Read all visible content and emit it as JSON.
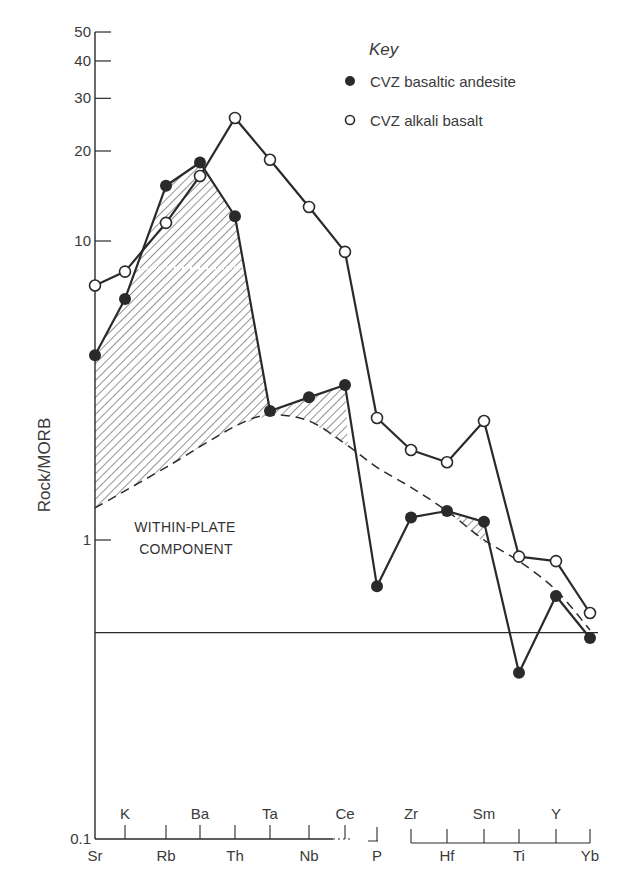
{
  "chart_data": {
    "type": "line",
    "title": "",
    "ylabel": "Rock/MORB",
    "xlabel": "",
    "yscale": "log",
    "ylim": [
      0.1,
      50
    ],
    "y_ticks": [
      0.1,
      1,
      10,
      20,
      30,
      40,
      50
    ],
    "y_tick_labels": [
      "0.1",
      "1",
      "10",
      "20",
      "30",
      "40",
      "50"
    ],
    "categories": [
      "Sr",
      "K",
      "Rb",
      "Ba",
      "Th",
      "Ta",
      "Nb",
      "Ce",
      "P",
      "Zr",
      "Hf",
      "Sm",
      "Ti",
      "Y",
      "Yb"
    ],
    "category_label_rows": {
      "upper": [
        "K",
        "Ba",
        "Ta",
        "Ce",
        "Zr",
        "Sm",
        "Y"
      ],
      "lower": [
        "Sr",
        "Rb",
        "Th",
        "Nb",
        "P",
        "Hf",
        "Ti",
        "Yb"
      ]
    },
    "series": [
      {
        "name": "CVZ basaltic andesite",
        "marker": "filled-circle",
        "values": [
          4.15,
          6.4,
          15.3,
          18.3,
          12.1,
          2.7,
          3.0,
          3.3,
          0.7,
          1.19,
          1.25,
          1.15,
          0.36,
          0.65,
          0.47
        ]
      },
      {
        "name": "CVZ alkali basalt",
        "marker": "open-circle",
        "values": [
          7.1,
          7.9,
          11.5,
          16.5,
          25.8,
          18.7,
          13.0,
          9.2,
          2.56,
          2.0,
          1.82,
          2.5,
          0.88,
          0.85,
          0.57
        ]
      }
    ],
    "within_plate_component_curve": {
      "style": "dashed",
      "points": [
        [
          "Sr",
          1.28
        ],
        [
          "Rb",
          1.75
        ],
        [
          "Th",
          2.4
        ],
        [
          "Ta",
          2.62
        ],
        [
          "Nb",
          2.5
        ],
        [
          "Ce",
          2.1
        ],
        [
          "P",
          1.75
        ],
        [
          "Zr",
          1.5
        ],
        [
          "Hf",
          1.25
        ],
        [
          "Sm",
          1.0
        ],
        [
          "Ti",
          0.85
        ],
        [
          "Y",
          0.68
        ],
        [
          "Yb",
          0.5
        ]
      ]
    },
    "reference_line": {
      "value": 0.49,
      "style": "solid"
    },
    "shaded_regions": "Hatched area between basaltic andesite and within-plate component curve (enrichment above the within-plate component)",
    "grid": false,
    "legend": {
      "title": "Key",
      "position": "top-right",
      "entries": [
        "CVZ basaltic andesite",
        "CVZ alkali basalt"
      ]
    },
    "annotations": [
      "WITHIN-PLATE",
      "COMPONENT"
    ]
  },
  "legend": {
    "title": "Key",
    "items": [
      {
        "label": "CVZ basaltic andesite",
        "marker": "filled-circle"
      },
      {
        "label": "CVZ alkali basalt",
        "marker": "open-circle"
      }
    ]
  },
  "axis": {
    "ylabel": "Rock/MORB"
  },
  "annotation": {
    "line1": "WITHIN-PLATE",
    "line2": "COMPONENT"
  },
  "colors": {
    "ink": "#2a2a2a",
    "text": "#3a3a3a",
    "background": "#ffffff"
  }
}
